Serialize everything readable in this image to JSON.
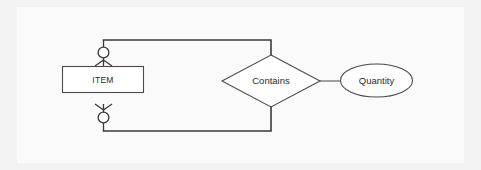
{
  "diagram": {
    "kind": "entity-relationship-diagram",
    "notation": "crow-foot",
    "title": "",
    "background_color": "#f3f3f3",
    "panel_color": "#fafafa",
    "line_color": "#3a3a3a",
    "shape_fill": "#ffffff",
    "shape_stroke": "#4a4a4a",
    "entities": [
      {
        "id": "item",
        "label": "ITEM",
        "shape": "rectangle"
      }
    ],
    "relationships": [
      {
        "id": "contains",
        "label": "Contains",
        "shape": "diamond",
        "degree": "unary-recursive",
        "connects": [
          "item",
          "item"
        ]
      }
    ],
    "attributes": [
      {
        "id": "quantity",
        "label": "Quantity",
        "shape": "ellipse",
        "owner": "contains"
      }
    ],
    "connectors": [
      {
        "id": "item-top-to-contains",
        "from": "item",
        "to": "contains",
        "from_cardinality": "zero-or-many",
        "routing": "orthogonal-top"
      },
      {
        "id": "item-bottom-to-contains",
        "from": "item",
        "to": "contains",
        "from_cardinality": "zero-or-many",
        "routing": "orthogonal-bottom"
      },
      {
        "id": "contains-to-quantity",
        "from": "contains",
        "to": "quantity",
        "from_cardinality": "",
        "routing": "straight"
      }
    ],
    "cardinality_symbols": {
      "optional_ring": "circle",
      "many": "crow-foot"
    }
  }
}
